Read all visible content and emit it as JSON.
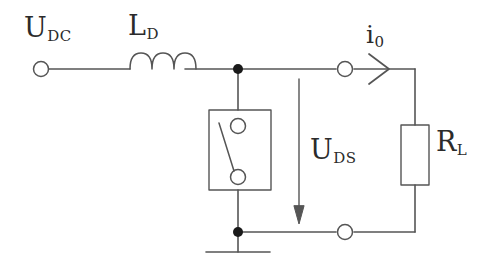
{
  "diagram": {
    "background_color": "#ffffff",
    "line_color": "#555555",
    "text_color": "#2b2b2b",
    "labels": {
      "source_voltage": {
        "base": "U",
        "sub": "DC"
      },
      "inductor": {
        "base": "L",
        "sub": "D"
      },
      "output_current": {
        "base": "i",
        "sub": "0"
      },
      "drain_source_voltage": {
        "base": "U",
        "sub": "DS"
      },
      "load_resistor": {
        "base": "R",
        "sub": "L"
      }
    },
    "components": [
      {
        "name": "input-terminal",
        "type": "terminal-circle"
      },
      {
        "name": "inductor",
        "type": "coil",
        "turns": 3
      },
      {
        "name": "top-junction",
        "type": "junction-dot"
      },
      {
        "name": "switch",
        "type": "switch-box",
        "state": "open"
      },
      {
        "name": "voltage-arrow",
        "type": "arrow",
        "direction": "down"
      },
      {
        "name": "output-terminal",
        "type": "terminal-circle"
      },
      {
        "name": "current-arrow",
        "type": "chevron-arrow",
        "direction": "right"
      },
      {
        "name": "load-resistor",
        "type": "resistor-box"
      },
      {
        "name": "return-terminal",
        "type": "terminal-circle"
      },
      {
        "name": "ground-junction",
        "type": "junction-dot"
      },
      {
        "name": "ground",
        "type": "ground-symbol"
      }
    ]
  }
}
